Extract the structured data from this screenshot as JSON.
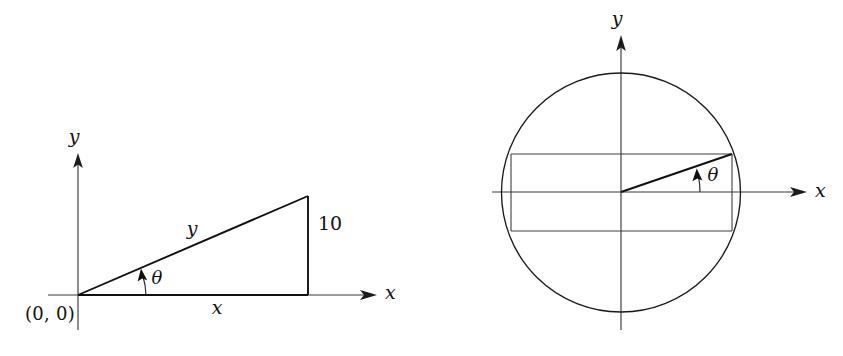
{
  "figure": {
    "domain": "diagram",
    "background_color": "#ffffff",
    "ink_color": "#111111",
    "axis_color": "#3a3a3a",
    "width": 843,
    "height": 356,
    "panels": [
      {
        "id": "left",
        "name": "right-triangle-panel",
        "description": "Right triangle on x-y axes with legs x and 10 and hypotenuse y, angle theta at origin",
        "origin": {
          "x": 78,
          "y": 295,
          "label": "(0, 0)"
        },
        "axes": {
          "x_label": "x",
          "y_label": "y",
          "x_min": 48,
          "x_max": 375,
          "y_top": 157,
          "y_bottom": 330
        },
        "triangle": {
          "vertices": [
            {
              "name": "origin",
              "x": 78,
              "y": 295
            },
            {
              "name": "foot",
              "x": 308,
              "y": 295
            },
            {
              "name": "apex",
              "x": 308,
              "y": 196
            }
          ],
          "base_label": "x",
          "height_label": "10",
          "hypotenuse_label": "y",
          "angle_label": "θ"
        }
      },
      {
        "id": "right",
        "name": "circle-band-panel",
        "description": "Circle centered at origin with an inscribed horizontal band and a radius drawn at angle theta",
        "center": {
          "x": 621,
          "y": 192
        },
        "radius": 119.5,
        "axes": {
          "x_label": "x",
          "y_label": "y",
          "x_min": 502,
          "x_max": 805,
          "y_top": 38,
          "y_bottom": 330
        },
        "band": {
          "left": 511,
          "right": 732,
          "top": 154,
          "bottom": 231
        },
        "radius_line": {
          "from": {
            "x": 621,
            "y": 192
          },
          "to": {
            "x": 732,
            "y": 154
          }
        },
        "angle_label": "θ"
      }
    ]
  },
  "labels": {
    "left": {
      "y_axis": "y",
      "x_axis": "x",
      "origin": "(0, 0)",
      "base": "x",
      "height": "10",
      "hypotenuse": "y",
      "theta": "θ"
    },
    "right": {
      "y_axis": "y",
      "x_axis": "x",
      "theta": "θ"
    }
  }
}
